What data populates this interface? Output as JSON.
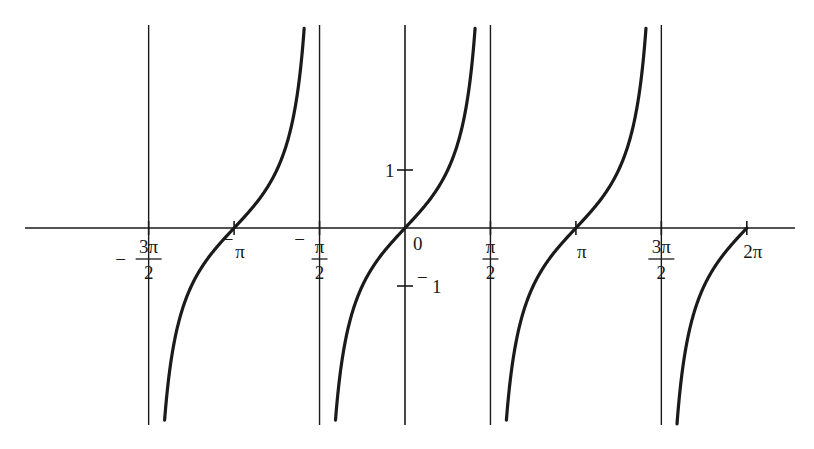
{
  "chart_data": {
    "type": "line",
    "title": "",
    "function": "y = tan x",
    "xlabel": "",
    "ylabel": "",
    "xlim": [
      -5.1,
      6.6
    ],
    "ylim": [
      -3.4,
      3.5
    ],
    "grid": false,
    "legend": null,
    "x_ticks": [
      {
        "value": -4.712389,
        "label": "-3π/2",
        "sign": "−",
        "num": "3π",
        "den": "2"
      },
      {
        "value": -3.141593,
        "label": "-π",
        "sign": "−",
        "num": "π",
        "den": ""
      },
      {
        "value": -1.570796,
        "label": "-π/2",
        "sign": "−",
        "num": "π",
        "den": "2"
      },
      {
        "value": 0,
        "label": "0",
        "sign": "",
        "num": "0",
        "den": ""
      },
      {
        "value": 1.570796,
        "label": "π/2",
        "sign": "",
        "num": "π",
        "den": "2"
      },
      {
        "value": 3.141593,
        "label": "π",
        "sign": "",
        "num": "π",
        "den": ""
      },
      {
        "value": 4.712389,
        "label": "3π/2",
        "sign": "",
        "num": "3π",
        "den": "2"
      },
      {
        "value": 6.283185,
        "label": "2π",
        "sign": "",
        "num": "2π",
        "den": ""
      }
    ],
    "y_ticks": [
      {
        "value": 1,
        "label": "1"
      },
      {
        "value": -1,
        "label": "−1"
      }
    ],
    "asymptotes": [
      -4.712389,
      -1.570796,
      1.570796,
      4.712389
    ],
    "series": [
      {
        "name": "tan x branch 1",
        "x_range": [
          -4.712389,
          -1.570796
        ],
        "points": [
          [
            -4.45,
            -3.6
          ],
          [
            -3.93,
            -1.0
          ],
          [
            -3.141593,
            0
          ],
          [
            -2.36,
            1.0
          ],
          [
            -1.84,
            3.6
          ]
        ]
      },
      {
        "name": "tan x branch 2",
        "x_range": [
          -1.570796,
          1.570796
        ],
        "points": [
          [
            -1.3,
            -3.6
          ],
          [
            -0.785,
            -1.0
          ],
          [
            0,
            0
          ],
          [
            0.785,
            1.0
          ],
          [
            1.3,
            3.6
          ]
        ]
      },
      {
        "name": "tan x branch 3",
        "x_range": [
          1.570796,
          4.712389
        ],
        "points": [
          [
            1.84,
            -3.6
          ],
          [
            2.36,
            -1.0
          ],
          [
            3.141593,
            0
          ],
          [
            3.93,
            1.0
          ],
          [
            4.45,
            3.6
          ]
        ]
      },
      {
        "name": "tan x branch 4 (partial)",
        "x_range": [
          4.712389,
          6.283185
        ],
        "points": [
          [
            4.98,
            -3.6
          ],
          [
            5.5,
            -1.0
          ],
          [
            6.283185,
            0
          ]
        ]
      }
    ]
  },
  "colors": {
    "ink": "#1a1a1a",
    "background": "#ffffff"
  },
  "layout": {
    "origin_px": [
      405,
      228
    ],
    "px_per_x_unit": 54.4,
    "px_per_y_unit": 58,
    "axis_x_px": [
      25,
      795
    ],
    "curve_top_px": 25,
    "curve_bottom_px": 425
  }
}
